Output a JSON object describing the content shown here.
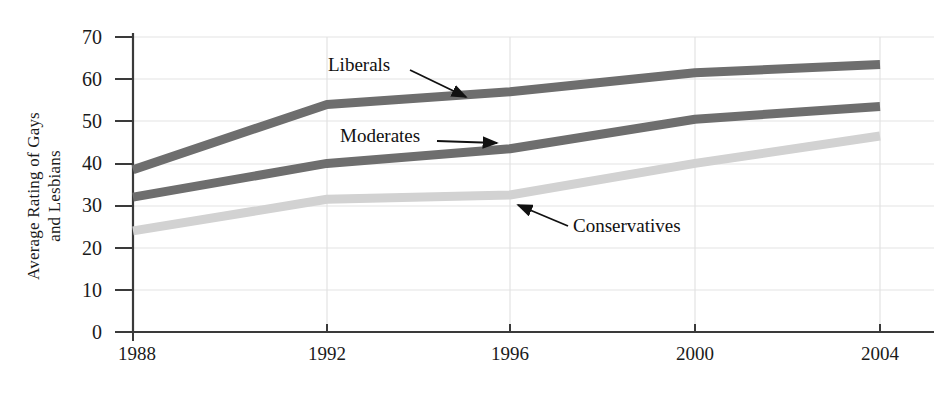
{
  "chart_data": {
    "type": "line",
    "title": "",
    "subtitle": "",
    "xlabel": "",
    "ylabel": "Average Rating of Gays and Lesbians",
    "ylabel_lines": [
      "Average Rating of Gays",
      "and Lesbians"
    ],
    "categories": [
      "1988",
      "1992",
      "1996",
      "2000",
      "2004"
    ],
    "x": [
      1988,
      1992,
      1996,
      2000,
      2004
    ],
    "xlim": [
      1988,
      2004
    ],
    "ylim": [
      0,
      70
    ],
    "y_ticks": [
      0,
      10,
      20,
      30,
      40,
      50,
      60,
      70
    ],
    "y_tick_labels": [
      "0",
      "10",
      "20",
      "30",
      "40",
      "50",
      "60",
      "70"
    ],
    "x_tick_labels": [
      "1988",
      "1992",
      "1996",
      "2000",
      "2004"
    ],
    "grid": true,
    "grid_axis": "both",
    "legend": "annotations-inline",
    "series": [
      {
        "name": "Liberals",
        "color": "#6e6e6e",
        "values": [
          38.5,
          54,
          57,
          61.5,
          63.5
        ]
      },
      {
        "name": "Moderates",
        "color": "#6e6e6e",
        "values": [
          32,
          40,
          43.5,
          50.5,
          53.5
        ]
      },
      {
        "name": "Conservatives",
        "color": "#d2d2d2",
        "values": [
          24,
          31.5,
          32.5,
          40,
          46.5
        ]
      }
    ],
    "annotations": [
      {
        "text": "Liberals",
        "series": "Liberals"
      },
      {
        "text": "Moderates",
        "series": "Moderates"
      },
      {
        "text": "Conservatives",
        "series": "Conservatives"
      }
    ]
  },
  "colors": {
    "axis": "#3a3a3a",
    "grid": "#e2e2e2",
    "text": "#1a1a1a",
    "liberals": "#6e6e6e",
    "moderates": "#6e6e6e",
    "conservatives": "#d2d2d2",
    "background": "#ffffff"
  },
  "y_labels": {
    "t70": "70",
    "t60": "60",
    "t50": "50",
    "t40": "40",
    "t30": "30",
    "t20": "20",
    "t10": "10",
    "t0": "0"
  },
  "x_labels": {
    "x1988": "1988",
    "x1992": "1992",
    "x1996": "1996",
    "x2000": "2000",
    "x2004": "2004"
  },
  "axis_title": {
    "line1": "Average Rating of Gays",
    "line2": "and Lesbians"
  },
  "annotations": {
    "liberals": "Liberals",
    "moderates": "Moderates",
    "conservatives": "Conservatives"
  }
}
